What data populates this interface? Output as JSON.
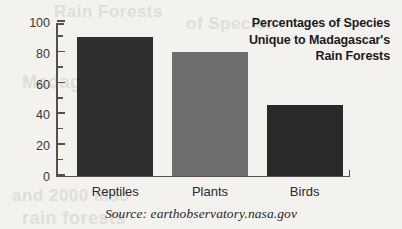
{
  "background_color": "#f3f2ee",
  "axis_color": "#54524e",
  "title": {
    "lines": [
      "Percentages of Species",
      "Unique to Madagascar's",
      "Rain Forests"
    ]
  },
  "source": {
    "text": "Source: earthobservatory.nasa.gov"
  },
  "artifacts": {
    "bleed_1": "Rain Forests",
    "bleed_2": "of Species",
    "bleed_3": "Madagascar",
    "bleed_4": "and 2000 also",
    "bleed_5": "rain forests"
  },
  "chart_data": {
    "type": "bar",
    "title": "Percentages of Species Unique to Madagascar's Rain Forests",
    "xlabel": "",
    "ylabel": "",
    "ylim": [
      0,
      100
    ],
    "grid": false,
    "legend": "none",
    "categories": [
      "Reptiles",
      "Plants",
      "Birds"
    ],
    "values": [
      90,
      80,
      46
    ],
    "bar_colors": [
      "#2e2e2e",
      "#6e6e6e",
      "#2a2a2a"
    ],
    "y_ticks_major": [
      0,
      20,
      40,
      60,
      80,
      100
    ],
    "y_ticks_minor": [
      10,
      30,
      50,
      70,
      90
    ],
    "y_tick_labels": [
      "0",
      "20",
      "40",
      "60",
      "80",
      "100"
    ]
  }
}
